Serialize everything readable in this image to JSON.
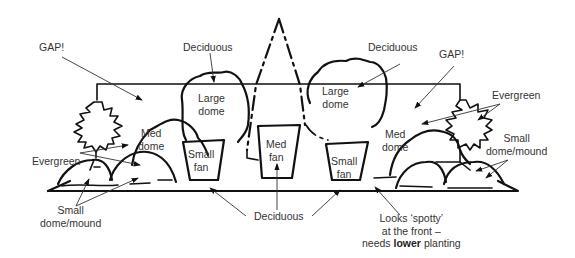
{
  "diagram": {
    "colors": {
      "ink": "#111111",
      "text": "#333333",
      "background": "#ffffff"
    },
    "labels": {
      "gap_left": "GAP!",
      "gap_right": "GAP!",
      "deciduous_left_top": "Deciduous",
      "deciduous_right_top": "Deciduous",
      "evergreen_left": "Evergreen",
      "evergreen_right": "Evergreen",
      "small_dome_left_line1": "Small",
      "small_dome_left_line2": "dome/mound",
      "small_dome_right_line1": "Small",
      "small_dome_right_line2": "dome/mound",
      "deciduous_bottom": "Deciduous",
      "spotty_line1": "Looks ‘spotty’",
      "spotty_line2": "at the front –",
      "spotty_line3_prefix": "needs ",
      "spotty_line3_bold": "lower",
      "spotty_line3_suffix": " planting"
    },
    "plants": [
      {
        "id": "large-dome-left",
        "line1": "Large",
        "line2": "dome"
      },
      {
        "id": "large-dome-right",
        "line1": "Large",
        "line2": "dome"
      },
      {
        "id": "med-dome-left",
        "line1": "Med",
        "line2": "dome"
      },
      {
        "id": "med-dome-right",
        "line1": "Med",
        "line2": "dome"
      },
      {
        "id": "small-fan-left",
        "line1": "Small",
        "line2": "fan"
      },
      {
        "id": "med-fan-center",
        "line1": "Med",
        "line2": "fan"
      },
      {
        "id": "small-fan-right",
        "line1": "Small",
        "line2": "fan"
      }
    ]
  }
}
